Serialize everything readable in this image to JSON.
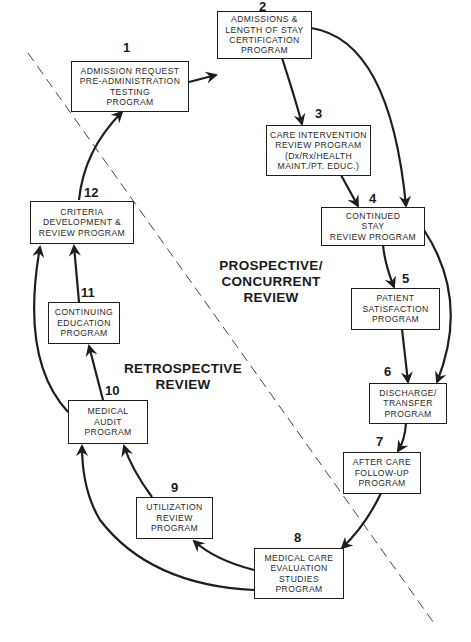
{
  "diagram": {
    "type": "cyclic-flow",
    "divider": "dashed diagonal line separating prospective/concurrent from retrospective review",
    "zones": [
      {
        "id": "prospective",
        "lines": [
          "PROSPECTIVE/",
          "CONCURRENT",
          "REVIEW"
        ]
      },
      {
        "id": "retrospective",
        "lines": [
          "RETROSPECTIVE",
          "REVIEW"
        ]
      }
    ],
    "steps": [
      {
        "number": "1",
        "lines": [
          "ADMISSION REQUEST",
          "PRE-ADMINISTRATION",
          "TESTING",
          "PROGRAM"
        ]
      },
      {
        "number": "2",
        "lines": [
          "ADMISSIONS &",
          "LENGTH OF STAY",
          "CERTIFICATION",
          "PROGRAM"
        ]
      },
      {
        "number": "3",
        "lines": [
          "CARE INTERVENTION",
          "REVIEW PROGRAM",
          "(Dx/Rx/HEALTH",
          "MAINT./PT. EDUC.)"
        ]
      },
      {
        "number": "4",
        "lines": [
          "CONTINUED",
          "STAY",
          "REVIEW PROGRAM"
        ]
      },
      {
        "number": "5",
        "lines": [
          "PATIENT",
          "SATISFACTION",
          "PROGRAM"
        ]
      },
      {
        "number": "6",
        "lines": [
          "DISCHARGE/",
          "TRANSFER",
          "PROGRAM"
        ]
      },
      {
        "number": "7",
        "lines": [
          "AFTER CARE",
          "FOLLOW-UP",
          "PROGRAM"
        ]
      },
      {
        "number": "8",
        "lines": [
          "MEDICAL CARE",
          "EVALUATION",
          "STUDIES",
          "PROGRAM"
        ]
      },
      {
        "number": "9",
        "lines": [
          "UTILIZATION",
          "REVIEW",
          "PROGRAM"
        ]
      },
      {
        "number": "10",
        "lines": [
          "MEDICAL",
          "AUDIT",
          "PROGRAM"
        ]
      },
      {
        "number": "11",
        "lines": [
          "CONTINUING",
          "EDUCATION",
          "PROGRAM"
        ]
      },
      {
        "number": "12",
        "lines": [
          "CRITERIA",
          "DEVELOPMENT &",
          "REVIEW PROGRAM"
        ]
      }
    ],
    "arrows": [
      {
        "from": "1",
        "to": "2"
      },
      {
        "from": "2",
        "to": "3"
      },
      {
        "from": "2",
        "to": "4"
      },
      {
        "from": "3",
        "to": "4"
      },
      {
        "from": "4",
        "to": "5"
      },
      {
        "from": "4",
        "to": "6"
      },
      {
        "from": "5",
        "to": "6"
      },
      {
        "from": "6",
        "to": "7"
      },
      {
        "from": "7",
        "to": "8"
      },
      {
        "from": "8",
        "to": "9"
      },
      {
        "from": "8",
        "to": "10"
      },
      {
        "from": "9",
        "to": "10"
      },
      {
        "from": "10",
        "to": "11"
      },
      {
        "from": "10",
        "to": "12"
      },
      {
        "from": "11",
        "to": "12"
      },
      {
        "from": "12",
        "to": "1"
      }
    ],
    "colors": {
      "ink": "#1e1e1e",
      "background": "#ffffff"
    }
  }
}
